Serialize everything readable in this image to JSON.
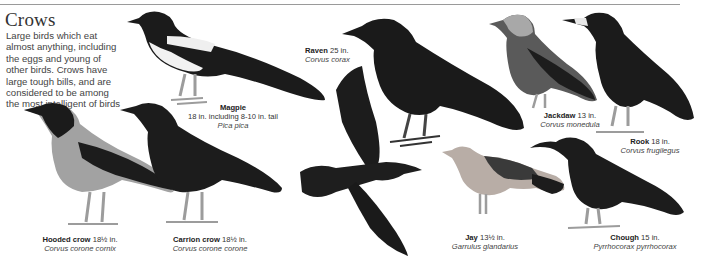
{
  "page": {
    "title": "Crows",
    "intro": "Large birds which eat almost anything, including the eggs and young of other birds. Crows have large tough bills, and are considered to be among the most intelligent of birds"
  },
  "birds": [
    {
      "id": "magpie",
      "name": "Magpie",
      "size": "18 in. including 8-10 in. tail",
      "latin": "Pica pica"
    },
    {
      "id": "hooded-crow",
      "name": "Hooded crow",
      "size": "18½ in.",
      "latin": "Corvus corone cornix"
    },
    {
      "id": "carrion-crow",
      "name": "Carrion crow",
      "size": "18½ in.",
      "latin": "Corvus corone corone"
    },
    {
      "id": "raven",
      "name": "Raven",
      "size": "25 in.",
      "latin": "Corvus corax"
    },
    {
      "id": "jackdaw",
      "name": "Jackdaw",
      "size": "13 in.",
      "latin": "Corvus monedula"
    },
    {
      "id": "rook",
      "name": "Rook",
      "size": "18 in.",
      "latin": "Corvus frugilegus"
    },
    {
      "id": "jay",
      "name": "Jay",
      "size": "13½ in.",
      "latin": "Garrulus glandarius"
    },
    {
      "id": "chough",
      "name": "Chough",
      "size": "15 in.",
      "latin": "Pyrrhocorax pyrrhocorax"
    }
  ],
  "colors": {
    "black_plumage": "#1c1c1c",
    "grey_plumage": "#9a9a9a",
    "jay_body": "#b8ada6",
    "white": "#f4f4f4",
    "legs": "#9c9c9c"
  }
}
